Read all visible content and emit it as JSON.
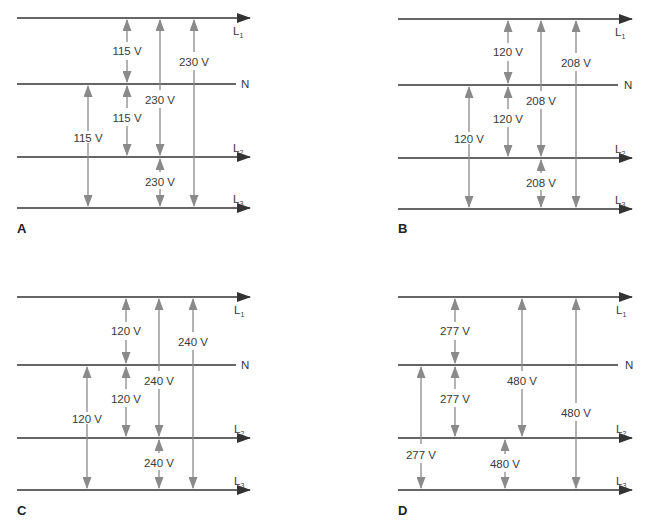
{
  "colors": {
    "bus_line": "#333333",
    "voltage_arrow": "#8a8a8a",
    "text": "#3a3a3a",
    "background": "#ffffff"
  },
  "line_labels": {
    "L1": {
      "main": "L",
      "sub": "1"
    },
    "N": {
      "main": "N"
    },
    "L2": {
      "main": "L",
      "sub": "2"
    },
    "L3": {
      "main": "L",
      "sub": "3"
    }
  },
  "panels": [
    {
      "id": "A",
      "letter": "A",
      "voltages": {
        "l1_n": "115 V",
        "n_l2": "115 V",
        "n_l3": "115 V",
        "l1_l2": "230 V",
        "l2_l3": "230 V",
        "l1_l3": "230 V"
      }
    },
    {
      "id": "B",
      "letter": "B",
      "voltages": {
        "l1_n": "120 V",
        "n_l2": "120 V",
        "n_l3": "120 V",
        "l1_l2": "208 V",
        "l2_l3": "208 V",
        "l1_l3": "208 V"
      }
    },
    {
      "id": "C",
      "letter": "C",
      "voltages": {
        "l1_n": "120 V",
        "n_l2": "120 V",
        "n_l3": "120 V",
        "l1_l2": "240 V",
        "l2_l3": "240 V",
        "l1_l3": "240 V"
      }
    },
    {
      "id": "D",
      "letter": "D",
      "voltages": {
        "l1_n": "277 V",
        "n_l2": "277 V",
        "n_l3": "277 V",
        "l1_l2": "480 V",
        "l2_l3": "480 V",
        "l1_l3": "480 V"
      }
    }
  ]
}
